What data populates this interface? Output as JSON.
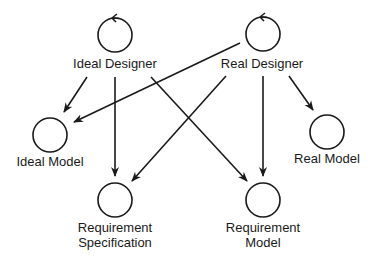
{
  "diagram": {
    "nodes": [
      {
        "id": "ideal_designer",
        "label": [
          "Ideal Designer"
        ],
        "cx": 115,
        "cy": 35,
        "self_loop": true
      },
      {
        "id": "real_designer",
        "label": [
          "Real Designer"
        ],
        "cx": 263,
        "cy": 34,
        "self_loop": true
      },
      {
        "id": "ideal_model",
        "label": [
          "Ideal Model"
        ],
        "cx": 47,
        "cy": 136,
        "self_loop": false
      },
      {
        "id": "real_model",
        "label": [
          "Real Model"
        ],
        "cx": 327,
        "cy": 130,
        "self_loop": false
      },
      {
        "id": "requirement_specification",
        "label": [
          "Requirement",
          "Specification"
        ],
        "cx": 115,
        "cy": 199,
        "self_loop": false
      },
      {
        "id": "requirement_model",
        "label": [
          "Requirement",
          "Model"
        ],
        "cx": 263,
        "cy": 199,
        "self_loop": false
      }
    ],
    "edges": [
      {
        "from": "ideal_designer",
        "to": "ideal_model"
      },
      {
        "from": "ideal_designer",
        "to": "requirement_specification"
      },
      {
        "from": "ideal_designer",
        "to": "requirement_model"
      },
      {
        "from": "real_designer",
        "to": "ideal_model"
      },
      {
        "from": "real_designer",
        "to": "requirement_specification"
      },
      {
        "from": "real_designer",
        "to": "requirement_model"
      },
      {
        "from": "real_designer",
        "to": "real_model"
      }
    ],
    "labels": {
      "ideal_designer": "Ideal Designer",
      "real_designer": "Real Designer",
      "ideal_model": "Ideal Model",
      "real_model": "Real Model",
      "req_spec_line1": "Requirement",
      "req_spec_line2": "Specification",
      "req_model_line1": "Requirement",
      "req_model_line2": "Model"
    },
    "colors": {
      "stroke": "#1a1a1a",
      "background": "#ffffff"
    }
  }
}
